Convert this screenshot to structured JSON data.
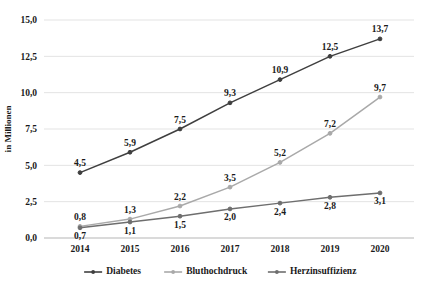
{
  "chart_data": {
    "type": "line",
    "title": "",
    "xlabel": "",
    "ylabel": "in Millionen",
    "categories": [
      "2014",
      "2015",
      "2016",
      "2017",
      "2018",
      "2019",
      "2020"
    ],
    "ylim": [
      0,
      15
    ],
    "ytick_values": [
      0,
      2.5,
      5,
      7.5,
      10,
      12.5,
      15
    ],
    "ytick_labels": [
      "0,0",
      "2,5",
      "5,0",
      "7,5",
      "10,0",
      "12,5",
      "15,0"
    ],
    "grid": true,
    "legend_position": "bottom",
    "series": [
      {
        "name": "Diabetes",
        "color": "#3f3f3f",
        "values": [
          4.5,
          5.9,
          7.5,
          9.3,
          10.9,
          12.5,
          13.7
        ],
        "labels": [
          "4,5",
          "5,9",
          "7,5",
          "9,3",
          "10,9",
          "12,5",
          "13,7"
        ],
        "label_side": [
          "above",
          "above",
          "above",
          "above",
          "above",
          "above",
          "above"
        ]
      },
      {
        "name": "Bluthochdruck",
        "color": "#a9a9a9",
        "values": [
          0.8,
          1.3,
          2.2,
          3.5,
          5.2,
          7.2,
          9.7
        ],
        "labels": [
          "0,8",
          "1,3",
          "2,2",
          "3,5",
          "5,2",
          "7,2",
          "9,7"
        ],
        "label_side": [
          "above",
          "above",
          "above",
          "above",
          "above",
          "above",
          "above"
        ]
      },
      {
        "name": "Herzinsuffizienz",
        "color": "#6e6e6e",
        "values": [
          0.7,
          1.1,
          1.5,
          2.0,
          2.4,
          2.8,
          3.1
        ],
        "labels": [
          "0,7",
          "1,1",
          "1,5",
          "2,0",
          "2,4",
          "2,8",
          "3,1"
        ],
        "label_side": [
          "below",
          "below",
          "below",
          "below",
          "below",
          "below",
          "below"
        ]
      }
    ]
  },
  "legend": {
    "items": [
      {
        "label": "Diabetes",
        "color": "#3f3f3f"
      },
      {
        "label": "Bluthochdruck",
        "color": "#a9a9a9"
      },
      {
        "label": "Herzinsuffizienz",
        "color": "#6e6e6e"
      }
    ]
  },
  "axes": {
    "y_title": "in Millionen"
  }
}
